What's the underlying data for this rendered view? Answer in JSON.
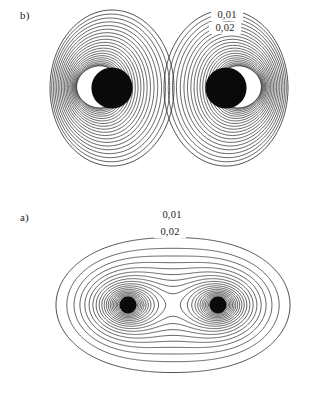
{
  "figure": {
    "background_color": "#ffffff",
    "line_color": "#222222",
    "text_color": "#1a1a1a",
    "width": 324,
    "height": 418
  },
  "panels": {
    "b": {
      "panel_label": "b)",
      "caption_position": "top-left",
      "contour_labels": [
        {
          "text": "0,01",
          "x": 227,
          "y": 18
        },
        {
          "text": "0,02",
          "x": 225,
          "y": 31
        }
      ]
    },
    "a": {
      "panel_label": "a)",
      "caption_position": "top-left",
      "contour_labels": [
        {
          "text": "0,01",
          "x": 172,
          "y": 18
        },
        {
          "text": "0,02",
          "x": 170,
          "y": 35
        }
      ]
    }
  },
  "chart_data": [
    {
      "id": "panel-b",
      "type": "contour",
      "title": "b)",
      "description": "Two separate closed contour lobes, each an eccentric set of nested ovals with a dense dark core. Left lobe core offset toward the inner (right) side; right lobe core offset toward the inner (left) side.",
      "xlabel": "",
      "ylabel": "",
      "grid": false,
      "legend": false,
      "labeled_levels": [
        "0,01",
        "0,02"
      ],
      "level_values": [
        0.01,
        0.02
      ],
      "level_step": 0.01,
      "n_contours": 22,
      "lobes": [
        {
          "name": "left-lobe",
          "center_x": 112,
          "center_y": 88,
          "core_radius": 22,
          "outer_rx": 62,
          "outer_ry": 78
        },
        {
          "name": "right-lobe",
          "center_x": 226,
          "center_y": 88,
          "core_radius": 22,
          "outer_rx": 62,
          "outer_ry": 78
        }
      ],
      "topology": "two disjoint single-well basins"
    },
    {
      "id": "panel-a",
      "type": "contour",
      "title": "a)",
      "description": "A single merged peanut/dumbbell contour family with two minima joined through a central saddle point; outer contours are simple closed ovals, inner contours split into a figure-eight about the two cores.",
      "xlabel": "",
      "ylabel": "",
      "grid": false,
      "legend": false,
      "labeled_levels": [
        "0,01",
        "0,02"
      ],
      "level_values": [
        0.01,
        0.02
      ],
      "level_step": 0.01,
      "n_contours": 24,
      "lobes": [
        {
          "name": "left-core",
          "center_x": 128,
          "center_y": 105,
          "core_radius": 9
        },
        {
          "name": "right-core",
          "center_x": 218,
          "center_y": 105,
          "core_radius": 9
        }
      ],
      "saddle": {
        "x": 173,
        "y": 105
      },
      "outer_extent": {
        "x_min": 55,
        "x_max": 289,
        "y_min": 15,
        "y_max": 186
      },
      "topology": "two wells merged through one saddle"
    }
  ]
}
